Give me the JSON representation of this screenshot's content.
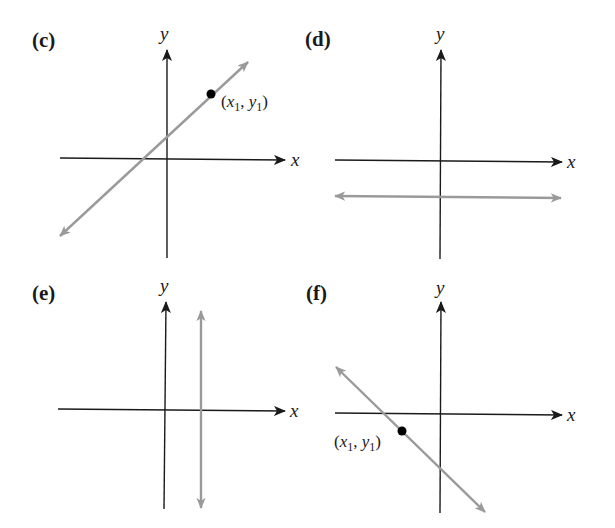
{
  "figure": {
    "panels": [
      {
        "id": "c",
        "label": "(c)",
        "description": "Line with positive slope through point (x1, y1)",
        "x_axis_label": "x",
        "y_axis_label": "y",
        "point_label_prefix": "(",
        "point_label_x": "x",
        "point_label_sub1": "1",
        "point_label_sep": ", ",
        "point_label_y": "y",
        "point_label_sub2": "1",
        "point_label_suffix": ")",
        "slope": "positive"
      },
      {
        "id": "d",
        "label": "(d)",
        "description": "Horizontal line below the x-axis",
        "x_axis_label": "x",
        "y_axis_label": "y",
        "slope": "zero"
      },
      {
        "id": "e",
        "label": "(e)",
        "description": "Vertical line to the right of the y-axis",
        "x_axis_label": "x",
        "y_axis_label": "y",
        "slope": "undefined"
      },
      {
        "id": "f",
        "label": "(f)",
        "description": "Line with negative slope through point (x1, y1)",
        "x_axis_label": "x",
        "y_axis_label": "y",
        "point_label_prefix": "(",
        "point_label_x": "x",
        "point_label_sub1": "1",
        "point_label_sep": ", ",
        "point_label_y": "y",
        "point_label_sub2": "1",
        "point_label_suffix": ")",
        "slope": "negative"
      }
    ],
    "colors": {
      "axis": "#1a1a1a",
      "line": "#9a9a9a",
      "point": "#000000"
    }
  }
}
